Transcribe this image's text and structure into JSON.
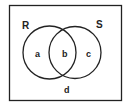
{
  "diagram": {
    "type": "venn",
    "universe": {
      "label": "d"
    },
    "sets": [
      {
        "label": "R",
        "region_label": "a"
      },
      {
        "label": "S",
        "region_label": "c"
      }
    ],
    "intersection_label": "b"
  },
  "colors": {
    "stroke": "#222222",
    "background": "#ffffff"
  }
}
